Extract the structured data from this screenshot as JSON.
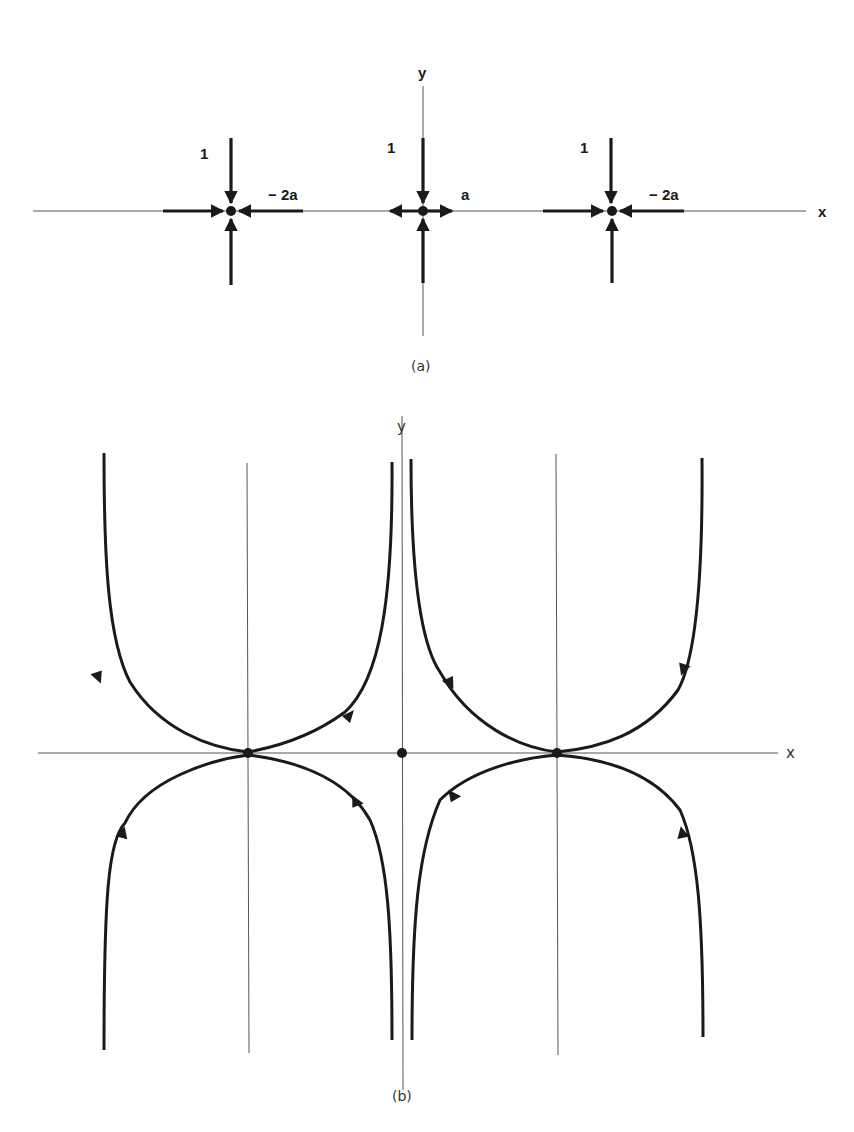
{
  "panel_a": {
    "caption": "(a)",
    "x_axis_label": "x",
    "y_axis_label": "y",
    "points": [
      {
        "id": "left",
        "vertical_label": "1",
        "horizontal_label": "− 2a",
        "horizontal_flow": "inward",
        "vertical_flow": "inward"
      },
      {
        "id": "center",
        "vertical_label": "1",
        "horizontal_label": "a",
        "horizontal_flow": "outward",
        "vertical_flow": "inward"
      },
      {
        "id": "right",
        "vertical_label": "1",
        "horizontal_label": "− 2a",
        "horizontal_flow": "inward",
        "vertical_flow": "inward"
      }
    ]
  },
  "panel_b": {
    "caption": "(b)",
    "x_axis_label": "x",
    "y_axis_label": "y",
    "fixed_points": [
      "left-sink",
      "origin",
      "right-sink"
    ],
    "trajectories": "eight curves approaching the two sinks on the x-axis from above and below, with arrows pointing toward the sinks"
  },
  "colors": {
    "ink": "#1a1a1a",
    "axis": "#555555",
    "background": "#ffffff"
  }
}
